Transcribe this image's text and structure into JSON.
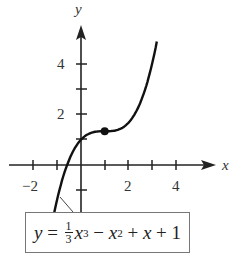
{
  "chart_data": {
    "type": "line",
    "title": "",
    "xlabel": "x",
    "ylabel": "y",
    "function": "y = (1/3)x^3 - x^2 + x + 1",
    "x_ticks": [
      -2,
      -1,
      0,
      1,
      2,
      3,
      4
    ],
    "x_tick_labels": [
      "-2",
      "2",
      "4"
    ],
    "y_ticks": [
      -1,
      1,
      2,
      3,
      4
    ],
    "y_tick_labels": [
      "2",
      "4"
    ],
    "xlim": [
      -2.4,
      5.7
    ],
    "ylim": [
      -3.3,
      5.3
    ],
    "grid": false,
    "series": [
      {
        "name": "y = 1/3 x^3 - x^2 + x + 1",
        "x": [
          -1.2,
          -1.0,
          -0.8,
          -0.6,
          -0.4,
          -0.2,
          0,
          0.2,
          0.4,
          0.6,
          0.8,
          1.0,
          1.2,
          1.4,
          1.6,
          1.8,
          2.0,
          2.2,
          2.4,
          2.6,
          2.8,
          3.0,
          3.2
        ],
        "y": [
          -3.62,
          -2.33,
          -1.47,
          -0.73,
          -0.18,
          0.92,
          1.0,
          1.16,
          1.26,
          1.31,
          1.33,
          1.33,
          1.34,
          1.38,
          1.45,
          1.59,
          1.67,
          1.91,
          2.25,
          2.71,
          3.29,
          4.0,
          4.88
        ]
      }
    ],
    "highlight_point": {
      "x": 1,
      "y": 1.3333,
      "label": "inflection point"
    },
    "annotation": "y = 1/3 x^3 − x^2 + x + 1"
  },
  "labels": {
    "x_axis": "x",
    "y_axis": "y",
    "tick_neg2": "−2",
    "tick_x2": "2",
    "tick_x4": "4",
    "tick_y2": "2",
    "tick_y4": "4"
  },
  "formula": {
    "lhs": "y",
    "eq": " = ",
    "frac_num": "1",
    "frac_den": "3",
    "x1": "x",
    "exp3": "3",
    "minus": " − ",
    "x2": "x",
    "exp2": "2",
    "plus1": " + ",
    "x3": "x",
    "plus2": " + ",
    "const": "1"
  }
}
